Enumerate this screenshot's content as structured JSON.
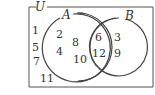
{
  "diagram": {
    "type": "venn",
    "universe_label": "U",
    "set_a_label": "A",
    "set_b_label": "B",
    "only_a": [
      "2",
      "4",
      "8",
      "10"
    ],
    "a_and_b": [
      "6",
      "12"
    ],
    "only_b": [
      "3",
      "9"
    ],
    "outside": [
      "1",
      "5",
      "7",
      "11"
    ],
    "colors": {
      "stroke": "#444444",
      "text": "#333333",
      "background": "#ffffff"
    }
  }
}
